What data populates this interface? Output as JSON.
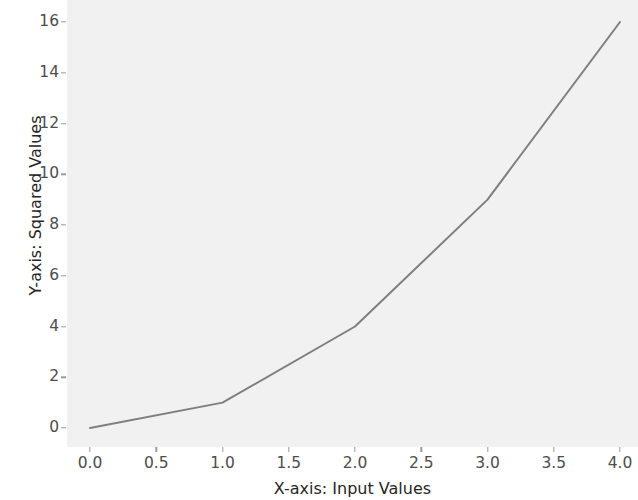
{
  "chart_data": {
    "type": "line",
    "title": "",
    "subtitle": "",
    "xlabel": "X-axis: Input Values",
    "ylabel": "Y-axis: Squared Values",
    "x": [
      0,
      1,
      2,
      3,
      4
    ],
    "values": [
      0,
      1,
      4,
      9,
      16
    ],
    "series": [
      {
        "name": "squared values",
        "x": [
          0,
          1,
          2,
          3,
          4
        ],
        "values": [
          0,
          1,
          4,
          9,
          16
        ]
      }
    ],
    "xlim": [
      0.0,
      4.0
    ],
    "ylim": [
      0,
      16
    ],
    "x_ticks": [
      0.0,
      0.5,
      1.0,
      1.5,
      2.0,
      2.5,
      3.0,
      3.5,
      4.0
    ],
    "x_tick_labels": [
      "0.0",
      "0.5",
      "1.0",
      "1.5",
      "2.0",
      "2.5",
      "3.0",
      "3.5",
      "4.0"
    ],
    "y_ticks": [
      0,
      2,
      4,
      6,
      8,
      10,
      12,
      14,
      16
    ],
    "y_tick_labels": [
      "0",
      "2",
      "4",
      "6",
      "8",
      "10",
      "12",
      "14",
      "16"
    ],
    "grid": false,
    "legend": "none",
    "line_color": "#7f7f7f",
    "line_width": 2,
    "marker": "none",
    "plot_background": "#f1f1f1",
    "figure_background": "#ffffff",
    "tick_label_color": "#4d4d4d",
    "axis_label_color": "#262626"
  }
}
